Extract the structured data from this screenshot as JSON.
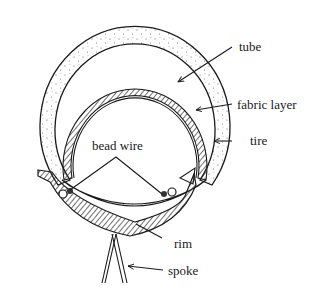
{
  "diagram": {
    "type": "cross-section",
    "labels": {
      "tube": "tube",
      "fabric_layer": "fabric layer",
      "tire": "tire",
      "bead_wire": "bead wire",
      "rim": "rim",
      "spoke": "spoke"
    },
    "colors": {
      "line": "#1a1a1a",
      "background": "#ffffff",
      "stipple": "#555555"
    }
  }
}
